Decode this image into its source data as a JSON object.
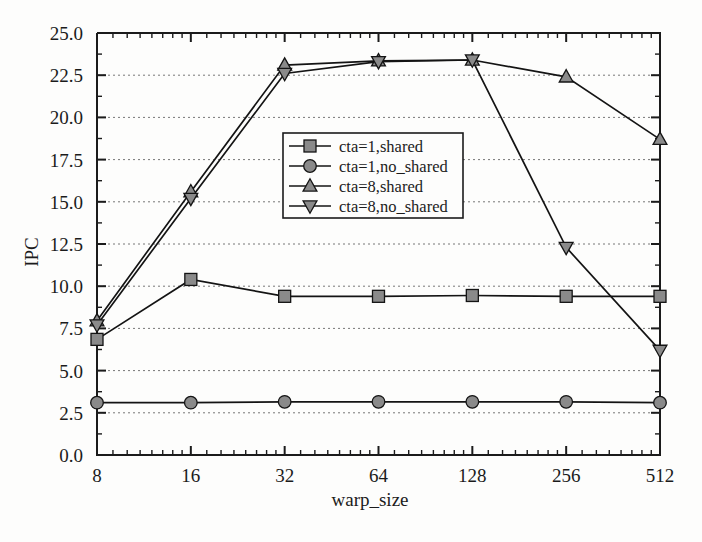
{
  "chart_data": {
    "type": "line",
    "title": "",
    "xlabel": "warp_size",
    "ylabel": "IPC",
    "x_scale": "log2",
    "x": [
      8,
      16,
      32,
      64,
      128,
      256,
      512
    ],
    "xtick_labels": [
      "8",
      "16",
      "32",
      "64",
      "128",
      "256",
      "512"
    ],
    "xlim": [
      8,
      512
    ],
    "ylim": [
      0.0,
      25.0
    ],
    "ytick_labels": [
      "0.0",
      "2.5",
      "5.0",
      "7.5",
      "10.0",
      "12.5",
      "15.0",
      "17.5",
      "20.0",
      "22.5",
      "25.0"
    ],
    "yticks": [
      0.0,
      2.5,
      5.0,
      7.5,
      10.0,
      12.5,
      15.0,
      17.5,
      20.0,
      22.5,
      25.0
    ],
    "grid": "horizontal-dotted",
    "legend_position": "center",
    "series": [
      {
        "name": "cta=1,shared",
        "marker": "square",
        "values": [
          6.85,
          10.4,
          9.4,
          9.4,
          9.45,
          9.4,
          9.4
        ]
      },
      {
        "name": "cta=1,no_shared",
        "marker": "circle",
        "values": [
          3.1,
          3.1,
          3.15,
          3.15,
          3.15,
          3.15,
          3.1
        ]
      },
      {
        "name": "cta=8,shared",
        "marker": "triangle-up",
        "values": [
          7.95,
          15.6,
          23.1,
          23.35,
          23.4,
          22.4,
          18.7
        ]
      },
      {
        "name": "cta=8,no_shared",
        "marker": "triangle-down",
        "values": [
          7.7,
          15.2,
          22.6,
          23.3,
          23.4,
          12.3,
          6.2
        ]
      }
    ],
    "colors": {
      "line": "#141414",
      "marker_fill": "#8a8a8a",
      "grid": "#777777",
      "axis": "#1b1b1b",
      "background": "#fdfdfc"
    }
  },
  "legend": {
    "entries": [
      {
        "label": "cta=1,shared",
        "marker": "square-marker-icon"
      },
      {
        "label": "cta=1,no_shared",
        "marker": "circle-marker-icon"
      },
      {
        "label": "cta=8,shared",
        "marker": "triangle-up-marker-icon"
      },
      {
        "label": "cta=8,no_shared",
        "marker": "triangle-down-marker-icon"
      }
    ]
  },
  "axes": {
    "x_title": "warp_size",
    "y_title": "IPC"
  }
}
